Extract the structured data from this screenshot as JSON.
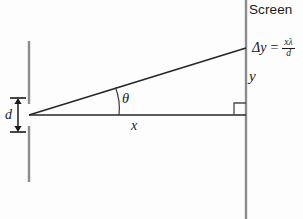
{
  "diagram": {
    "title_label": "Screen",
    "labels": {
      "delta_y_lhs": "Δy",
      "equals": "=",
      "fraction_numerator": "xλ",
      "fraction_denominator": "d",
      "y": "y",
      "x": "x",
      "d": "d",
      "theta": "θ"
    },
    "colors": {
      "background": "#fdfdfd",
      "ink": "#1a1a1a",
      "barrier": "#8c8c8c",
      "screen_line": "#8c8c8c",
      "ray": "#262626"
    },
    "geometry": {
      "slit_apex": [
        29,
        115
      ],
      "screen_x": 246,
      "baseline_y": 115,
      "ray_endpoint": [
        246,
        48
      ],
      "right_angle_size": 12,
      "barrier_top_segment": [
        29,
        41,
        29,
        104
      ],
      "barrier_bottom_segment": [
        29,
        126,
        29,
        182
      ],
      "d_arrow": [
        18,
        99,
        18,
        131
      ],
      "theta_arc_radius": 58
    }
  }
}
